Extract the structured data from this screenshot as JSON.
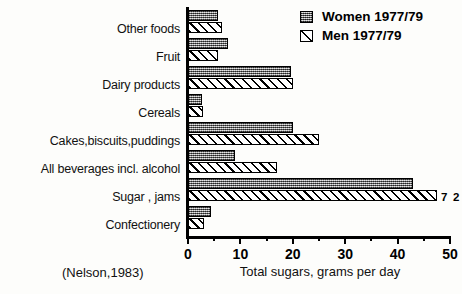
{
  "chart_data": {
    "type": "bar",
    "orientation": "horizontal",
    "title": "",
    "xlabel": "Total sugars, grams per day",
    "ylabel": "",
    "xlim": [
      0,
      50
    ],
    "xticks": [
      0,
      10,
      20,
      30,
      40,
      50
    ],
    "xticklabels": [
      "0",
      "10",
      "20",
      "30",
      "40",
      "50"
    ],
    "minor_xticks": [
      5,
      15,
      25,
      35,
      45
    ],
    "grid": false,
    "legend_position": "top-right",
    "categories": [
      "Other foods",
      "Fruit",
      "Dairy products",
      "Cereals",
      "Cakes,biscuits,puddings",
      "All beverages incl. alcohol",
      "Sugar , jams",
      "Confectionery"
    ],
    "series": [
      {
        "name": "Women 1977/79",
        "pattern": "stipple-grey",
        "values": [
          5.8,
          7.7,
          19.6,
          2.7,
          20.0,
          8.9,
          43.0,
          4.4
        ]
      },
      {
        "name": "Men 1977/79",
        "pattern": "diagonal-hatch",
        "values": [
          6.5,
          5.8,
          20.0,
          2.8,
          25.0,
          17.0,
          47.5,
          3.0
        ]
      }
    ],
    "annotations": [
      {
        "text": "7 2",
        "category": "Sugar , jams",
        "series": "Men 1977/79"
      }
    ],
    "source": "(Nelson,1983)"
  },
  "legend": {
    "items": [
      {
        "label": "Women 1977/79",
        "swatch": "women-stipple-swatch"
      },
      {
        "label": "Men 1977/79",
        "swatch": "men-hatch-swatch"
      }
    ]
  },
  "axis": {
    "x_title": "Total sugars, grams per day"
  },
  "footer": {
    "citation": "(Nelson,1983)"
  },
  "colors": {
    "background": "#fdfdfb",
    "ink": "#000000",
    "women_fill": "#9a9a9a",
    "men_fill": "#ffffff"
  }
}
